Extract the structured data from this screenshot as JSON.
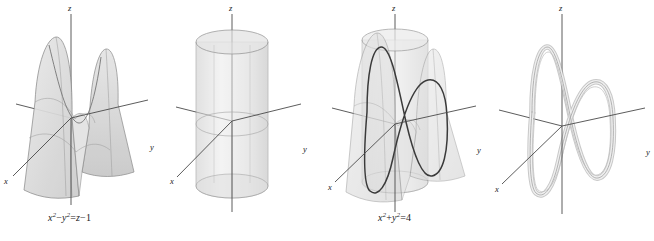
{
  "figure": {
    "background": "#ffffff",
    "surface_fill": "#d8d8d8",
    "surface_stroke": "#8a8a8a",
    "axis_color": "#4a4a4a",
    "curve_color": "#3a3a3a",
    "tube_light": "#e2e2e2",
    "tube_dark": "#9a9a9a",
    "panels": [
      {
        "id": "panel-1",
        "name": "hyperbolic-paraboloid-panel",
        "content": "hyperbolic paraboloid surface",
        "equation_text": "x2 - y2 = z - 1",
        "equation_parts": {
          "lhs_var1": "x",
          "lhs_exp1": "2",
          "minus": "−",
          "lhs_var2": "y",
          "lhs_exp2": "2",
          "equals": "=",
          "rhs_var": "z",
          "rhs_minus": "−",
          "rhs_const": "1"
        },
        "axis_labels": {
          "x": "x",
          "y": "y",
          "z": "z"
        }
      },
      {
        "id": "panel-2",
        "name": "circular-cylinder-panel",
        "content": "vertical circular cylinder of radius 2",
        "equation_text": "x2 + y2 = 4",
        "equation_parts": {
          "lhs_var1": "x",
          "lhs_exp1": "2",
          "plus": "+",
          "lhs_var2": "y",
          "lhs_exp2": "2",
          "equals": "=",
          "rhs_const": "4"
        },
        "axis_labels": {
          "x": "x",
          "y": "y",
          "z": "z"
        }
      },
      {
        "id": "panel-3",
        "name": "surfaces-intersection-panel",
        "content": "cylinder and hyperbolic paraboloid superimposed with intersection curve",
        "equation_text": "",
        "axis_labels": {
          "x": "x",
          "y": "y",
          "z": "z"
        }
      },
      {
        "id": "panel-4",
        "name": "space-curve-panel",
        "content": "intersection space curve drawn as a 3D tube",
        "equation_text": "",
        "axis_labels": {
          "x": "x",
          "y": "y",
          "z": "z"
        }
      }
    ]
  }
}
